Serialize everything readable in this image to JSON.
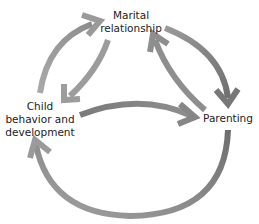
{
  "diagram": {
    "type": "cyclic-relationship-diagram",
    "nodes": [
      {
        "id": "marital",
        "lines": [
          "Marital",
          "relationship"
        ]
      },
      {
        "id": "child",
        "lines": [
          "Child",
          "behavior and",
          "development"
        ]
      },
      {
        "id": "parenting",
        "lines": [
          "Parenting"
        ]
      }
    ],
    "edges": [
      {
        "from": "child",
        "to": "marital",
        "style": "outer-left-arc"
      },
      {
        "from": "marital",
        "to": "child",
        "style": "inner-arc"
      },
      {
        "from": "marital",
        "to": "parenting",
        "style": "outer-right-arc"
      },
      {
        "from": "parenting",
        "to": "marital",
        "style": "inner-arc"
      },
      {
        "from": "child",
        "to": "parenting",
        "style": "middle-arc"
      },
      {
        "from": "parenting",
        "to": "child",
        "style": "bottom-large-arc"
      }
    ],
    "colors": {
      "arrow_light": "#a8a8a8",
      "arrow_dark": "#7a7a7a",
      "text": "#222222",
      "background": "#ffffff"
    }
  }
}
